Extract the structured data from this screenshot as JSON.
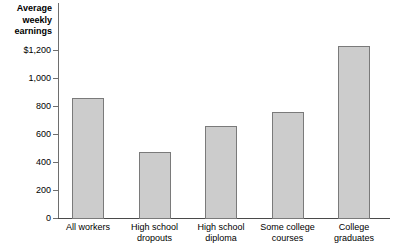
{
  "chart_data": {
    "type": "bar",
    "title": "Average weekly earnings",
    "title_lines": "Average\nweekly\nearnings",
    "xlabel": "",
    "ylabel": "Average weekly earnings",
    "ylim": [
      0,
      1200
    ],
    "grid": false,
    "legend": null,
    "categories": [
      "All workers",
      "High school dropouts",
      "High school diploma",
      "Some college courses",
      "College graduates"
    ],
    "category_lines": [
      "All workers",
      "High school\ndropouts",
      "High school\ndiploma",
      "Some college\ncourses",
      "College\ngraduates"
    ],
    "values": [
      855,
      470,
      660,
      755,
      1230
    ],
    "y_ticks": [
      0,
      200,
      400,
      600,
      800,
      1000,
      1200
    ],
    "y_tick_labels": [
      "0",
      "200",
      "400",
      "600",
      "800",
      "1,000",
      "$1,200"
    ],
    "bar_fill_color": "#cccccc",
    "bar_border_color": "#7a7a7a",
    "axis_color": "#6e6e6e",
    "text_color": "#000000"
  }
}
